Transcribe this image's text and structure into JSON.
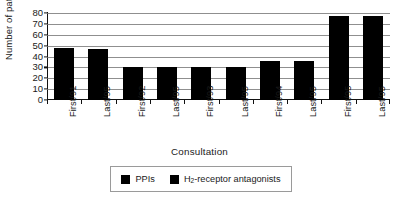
{
  "chart_data": {
    "type": "bar",
    "title": "",
    "xlabel": "Consultation",
    "ylabel": "Number of patients",
    "categories": [
      "First/91",
      "Last/95",
      "First/92",
      "Last/95",
      "First/93",
      "Last/95",
      "First/94",
      "Last/95",
      "First/95",
      "Last/95"
    ],
    "values": [
      48,
      47,
      30,
      30,
      30,
      30,
      36,
      36,
      77,
      77
    ],
    "ylim": [
      0,
      80
    ],
    "yticks": [
      0,
      10,
      20,
      30,
      40,
      50,
      60,
      70,
      80
    ],
    "ytick_labels": [
      "0",
      "10",
      "20",
      "30",
      "40",
      "50",
      "60",
      "70",
      "80"
    ],
    "grid": true,
    "grid_axis": "y",
    "bar_color": "#000000",
    "legend_position": "below-center",
    "series": [
      {
        "name": "PPIs",
        "color": "#000000"
      },
      {
        "name": "H2-receptor antagonists",
        "color": "#000000"
      }
    ]
  },
  "legend": {
    "entries": [
      {
        "label": "PPIs",
        "label_prefix": "PPIs",
        "label_sub": "",
        "label_suffix": "",
        "color": "#000000"
      },
      {
        "label": "H2-receptor antagonists",
        "label_prefix": "H",
        "label_sub": "2",
        "label_suffix": "-receptor antagonists",
        "color": "#000000"
      }
    ]
  }
}
